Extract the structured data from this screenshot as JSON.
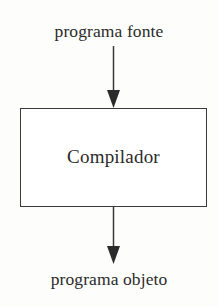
{
  "diagram": {
    "type": "flowchart",
    "title": "Compilador",
    "orientation": "vertical",
    "colors": {
      "background": "#fdfdfb",
      "stroke": "#3a3a3a",
      "text": "#2b2b2b",
      "box_fill": "#ffffff"
    },
    "input_label": "programa fonte",
    "process_label": "Compilador",
    "output_label": "programa objeto",
    "arrows": [
      {
        "name": "input-arrow",
        "direction": "down",
        "from": "programa fonte",
        "to": "Compilador"
      },
      {
        "name": "output-arrow",
        "direction": "down",
        "from": "Compilador",
        "to": "programa objeto"
      }
    ]
  }
}
